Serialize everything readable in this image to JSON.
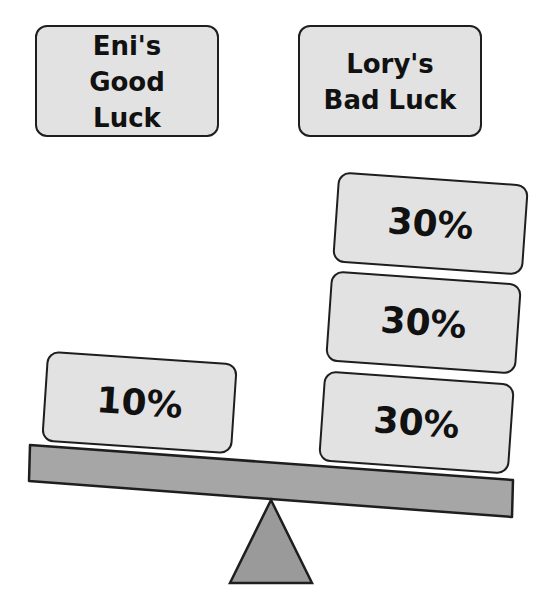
{
  "labels": {
    "left": "Eni's Good Luck",
    "right": "Lory's Bad Luck"
  },
  "left_pan": {
    "weights": [
      {
        "value": "10%"
      }
    ]
  },
  "right_pan": {
    "weights": [
      {
        "value": "30%"
      },
      {
        "value": "30%"
      },
      {
        "value": "30%"
      }
    ]
  },
  "colors": {
    "box_fill": "#e2e2e2",
    "beam_fill": "#a6a6a6",
    "fulcrum_fill": "#9a9a9a",
    "outline": "#1e1e1e"
  }
}
